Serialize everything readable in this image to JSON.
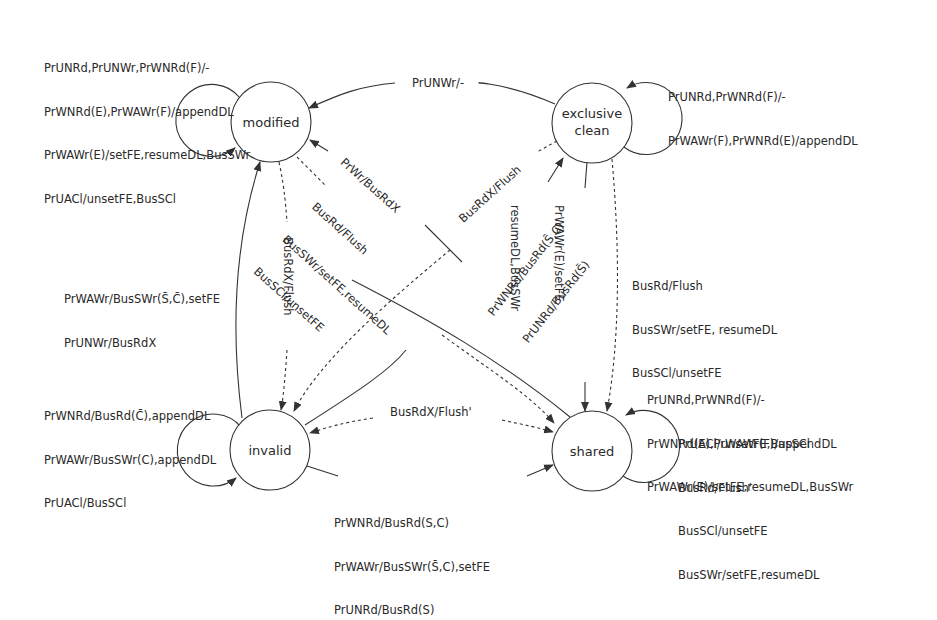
{
  "diagram": {
    "states": [
      {
        "id": "modified",
        "label": "modified"
      },
      {
        "id": "exclusive_clean",
        "label": "exclusive\nclean",
        "line1": "exclusive",
        "line2": "clean"
      },
      {
        "id": "invalid",
        "label": "invalid"
      },
      {
        "id": "shared",
        "label": "shared"
      }
    ],
    "self_loops": {
      "modified": [
        "PrUNRd,PrUNWr,PrWNRd(F)/-",
        "PrWNRd(E),PrWAWr(F)/appendDL",
        "PrWAWr(E)/setFE,resumeDL,BusSWr",
        "PrUACl/unsetFE,BusSCl"
      ],
      "exclusive_clean": [
        "PrUNRd,PrWNRd(F)/-",
        "PrWAWr(F),PrWNRd(E)/appendDL"
      ],
      "invalid": [
        "PrWNRd/BusRd(C̄),appendDL",
        "PrWAWr/BusSWr(C),appendDL",
        "PrUACl/BusSCl"
      ],
      "shared_top": [
        "PrUNRd,PrWNRd(F)/-",
        "PrWNRd(E),PrWAWr(F)/appendDL",
        "PrWAWr(E)/setFE,resumeDL,BusSWr"
      ],
      "shared_bottom": [
        "PrUACl/unsetFE,BusSCl",
        "BusRd/Flush'",
        "BusSCl/unsetFE",
        "BusSWr/setFE,resumeDL"
      ]
    },
    "transitions": {
      "exclusive_to_modified": "PrUNWr/-",
      "invalid_to_modified": [
        "PrWAWr/BusSWr(S̄,C̄),setFE",
        "PrUNWr/BusRdX"
      ],
      "modified_to_invalid": "BusRdX/Flush",
      "shared_to_modified": "PrWr/BusRdX",
      "modified_to_shared": [
        "BusRd/Flush",
        "BusSWr/setFE,resumeDL",
        "BusSCl/unsetFE"
      ],
      "exclusive_to_invalid": "BusRdX/Flush",
      "invalid_to_exclusive": [
        "PrWNRd/BusRd(S̄,C)",
        "PrUNRd/BusRd(S̄)"
      ],
      "exclusive_to_shared_solid": [
        "PrWAWr(E)/setFE,",
        "resumeDL,BusSWr"
      ],
      "exclusive_to_shared_dashed": [
        "BusRd/Flush",
        "BusSWr/setFE, resumeDL",
        "BusSCl/unsetFE"
      ],
      "shared_to_invalid": "BusRdX/Flush'",
      "invalid_to_shared": [
        "PrWNRd/BusRd(S,C)",
        "PrWAWr/BusSWr(S̄,C),setFE",
        "PrUNRd/BusRd(S)"
      ]
    },
    "colors": {
      "stroke": "#333333",
      "text": "#2a2a2a",
      "background": "#ffffff"
    }
  }
}
